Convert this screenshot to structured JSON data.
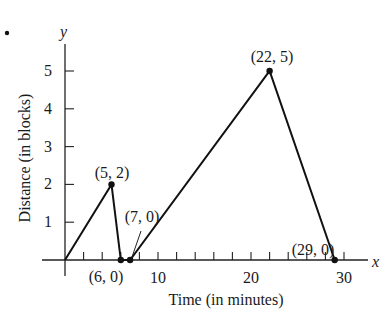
{
  "chart_data": {
    "type": "line",
    "title": "",
    "xlabel": "Time (in minutes)",
    "ylabel": "Distance (in blocks)",
    "x_axis_symbol": "x",
    "y_axis_symbol": "y",
    "xlim": [
      0,
      32
    ],
    "ylim": [
      0,
      5.5
    ],
    "x_ticks_minor_step": 2,
    "x_tick_labels": [
      "10",
      "20",
      "30"
    ],
    "y_tick_labels": [
      "1",
      "2",
      "3",
      "4",
      "5"
    ],
    "grid": false,
    "legend": null,
    "series": [
      {
        "name": "distance",
        "x": [
          0,
          5,
          6,
          7,
          22,
          29
        ],
        "y": [
          0,
          2,
          0,
          0,
          5,
          0
        ]
      }
    ],
    "point_labels": [
      {
        "text": "(5, 2)",
        "x": 5,
        "y": 2
      },
      {
        "text": "(6, 0)",
        "x": 6,
        "y": 0
      },
      {
        "text": "(7, 0)",
        "x": 7,
        "y": 0
      },
      {
        "text": "(22, 5)",
        "x": 22,
        "y": 5
      },
      {
        "text": "(29, 0)",
        "x": 29,
        "y": 0
      }
    ],
    "annotations": [
      "•"
    ]
  }
}
